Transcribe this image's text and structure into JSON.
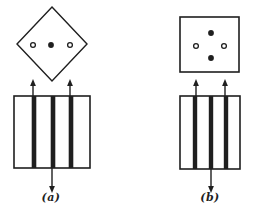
{
  "colors": {
    "background": "#ffffff",
    "ink": "#1f1f1f"
  },
  "panels": [
    {
      "label": "(a)",
      "label_pos": {
        "x": 51,
        "y": 197
      },
      "screen": {
        "shape": "diamond",
        "cx": 52,
        "cy": 44,
        "rx": 35,
        "ry": 37,
        "spots": [
          {
            "type": "open",
            "cx": 33,
            "cy": 45
          },
          {
            "type": "filled",
            "cx": 51,
            "cy": 45
          },
          {
            "type": "open",
            "cx": 70,
            "cy": 45
          }
        ]
      },
      "grating": {
        "x": 14,
        "y": 96,
        "w": 76,
        "h": 72,
        "bar_centers_x": [
          34,
          53,
          71
        ],
        "bar_width": 4.6
      },
      "arrows_up": [
        {
          "x": 33,
          "y_from": 96,
          "y_to": 79
        },
        {
          "x": 70,
          "y_from": 96,
          "y_to": 79
        }
      ],
      "arrow_down": {
        "x": 52,
        "y_from": 168,
        "y_to": 193
      }
    },
    {
      "label": "(b)",
      "label_pos": {
        "x": 210,
        "y": 197
      },
      "screen": {
        "shape": "square",
        "x": 180,
        "y": 17,
        "w": 59,
        "h": 55,
        "spots": [
          {
            "type": "filled",
            "cx": 211,
            "cy": 33
          },
          {
            "type": "open",
            "cx": 196,
            "cy": 46
          },
          {
            "type": "open",
            "cx": 224,
            "cy": 46
          },
          {
            "type": "filled",
            "cx": 211,
            "cy": 58
          }
        ]
      },
      "grating": {
        "x": 180,
        "y": 96,
        "w": 60,
        "h": 73,
        "bar_centers_x": [
          195,
          211,
          226
        ],
        "bar_width": 4.4
      },
      "arrows_up": [
        {
          "x": 196,
          "y_from": 96,
          "y_to": 79
        },
        {
          "x": 225,
          "y_from": 96,
          "y_to": 79
        }
      ],
      "arrow_down": {
        "x": 211,
        "y_from": 169,
        "y_to": 193
      }
    }
  ]
}
